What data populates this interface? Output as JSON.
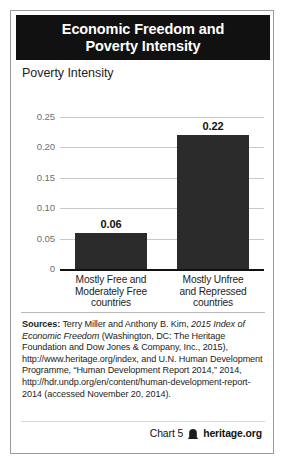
{
  "card": {
    "title_line1": "Economic Freedom and",
    "title_line2": "Poverty Intensity",
    "title_bg": "#111111",
    "title_color": "#ffffff"
  },
  "chart_data": {
    "type": "bar",
    "title": "Economic Freedom and Poverty Intensity",
    "ylabel": "Poverty Intensity",
    "xlabel": "",
    "categories": [
      "Mostly Free and Moderately Free countries",
      "Mostly Unfree and Repressed countries"
    ],
    "category_lines": [
      [
        "Mostly Free and",
        "Moderately Free",
        "countries"
      ],
      [
        "Mostly Unfree",
        "and Repressed",
        "countries"
      ]
    ],
    "values": [
      0.06,
      0.22
    ],
    "value_labels": [
      "0.06",
      "0.22"
    ],
    "ylim": [
      0,
      0.25
    ],
    "yticks": [
      0.25,
      0.2,
      0.15,
      0.1,
      0.05,
      0
    ],
    "ytick_labels": [
      "0.25",
      "0.20",
      "0.15",
      "0.10",
      "0.05",
      "0"
    ],
    "grid": true,
    "legend": false,
    "bar_color": "#2b2b2b",
    "gridline_color": "#c9c9c9",
    "axis_color": "#111111"
  },
  "sources": {
    "label": "Sources:",
    "segments": [
      {
        "text": " Terry Miller and Anthony B. Kim, ",
        "style": "normal"
      },
      {
        "text": "2015 Index of",
        "style": "italic"
      },
      {
        "text": " ",
        "style": "normal"
      },
      {
        "text": "Economic Freedom",
        "style": "italic"
      },
      {
        "text": " (Washington, DC: The Heritage Foundation and Dow Jones & Company, Inc., 2015), http://www.heritage.org/index, and U.N. Human Development Programme, “Human Development Report 2014,” 2014, http://hdr.undp.org/en/content/human-development-report-2014 (accessed November 20, 2014).",
        "style": "normal"
      }
    ]
  },
  "footer": {
    "chart_number": "Chart 5",
    "logo_name": "heritage-logo-icon",
    "brand": "heritage.org"
  }
}
